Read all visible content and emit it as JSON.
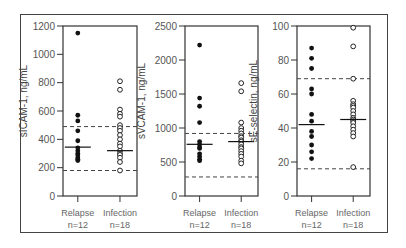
{
  "chart_data": [
    {
      "type": "scatter",
      "title": "",
      "ylabel": "sICAM-1, ng/mL",
      "ylim": [
        0,
        1200
      ],
      "yticks": [
        0,
        200,
        400,
        600,
        800,
        1000,
        1200
      ],
      "categories": [
        "Relapse\nn=12",
        "Infection\nn=18"
      ],
      "series": [
        {
          "name": "Relapse",
          "n": 12,
          "marker": "filled",
          "values": [
            1150,
            570,
            530,
            460,
            390,
            340,
            320,
            300,
            290,
            270,
            260,
            250
          ],
          "median": 345
        },
        {
          "name": "Infection",
          "n": 18,
          "marker": "open",
          "values": [
            810,
            750,
            610,
            580,
            560,
            500,
            480,
            460,
            430,
            400,
            370,
            350,
            320,
            300,
            290,
            270,
            240,
            180
          ],
          "median": 320
        }
      ],
      "reference_lines": [
        490,
        180
      ]
    },
    {
      "type": "scatter",
      "title": "",
      "ylabel": "sVCAM-1, ng/mL",
      "ylim": [
        0,
        2500
      ],
      "yticks": [
        0,
        500,
        1000,
        1500,
        2000,
        2500
      ],
      "categories": [
        "Relapse\nn=12",
        "Infection\nn=18"
      ],
      "series": [
        {
          "name": "Relapse",
          "n": 12,
          "marker": "filled",
          "values": [
            2220,
            1440,
            1320,
            1080,
            800,
            760,
            720,
            700,
            620,
            580,
            540,
            520
          ],
          "median": 760
        },
        {
          "name": "Infection",
          "n": 18,
          "marker": "open",
          "values": [
            1660,
            1540,
            1080,
            1000,
            960,
            920,
            880,
            860,
            820,
            800,
            760,
            720,
            700,
            660,
            620,
            580,
            520,
            480
          ],
          "median": 800
        }
      ],
      "reference_lines": [
        920,
        280
      ]
    },
    {
      "type": "scatter",
      "title": "",
      "ylabel": "sE-selectin, ng/mL",
      "ylim": [
        0,
        100
      ],
      "yticks": [
        0,
        20,
        40,
        60,
        80,
        100
      ],
      "categories": [
        "Relapse\nn=12",
        "Infection\nn=18"
      ],
      "series": [
        {
          "name": "Relapse",
          "n": 12,
          "marker": "filled",
          "values": [
            87,
            81,
            75,
            63,
            60,
            48,
            44,
            38,
            35,
            30,
            26,
            22
          ],
          "median": 42
        },
        {
          "name": "Infection",
          "n": 18,
          "marker": "open",
          "values": [
            99,
            88,
            69,
            56,
            54,
            53,
            52,
            50,
            48,
            46,
            45,
            44,
            43,
            41,
            39,
            37,
            35,
            17
          ],
          "median": 45
        },
        {
          "name": "",
          "values": []
        }
      ],
      "reference_lines": [
        69,
        16
      ]
    }
  ],
  "labels": {
    "relapse": "Relapse",
    "relapse_n": "n=12",
    "infection": "Infection",
    "infection_n": "n=18"
  }
}
